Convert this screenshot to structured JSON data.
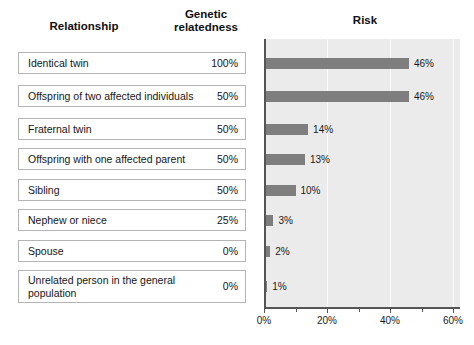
{
  "figure": {
    "table_headers": {
      "relationship": "Relationship",
      "relatedness": "Genetic\nrelatedness"
    },
    "relatedness_header_line1": "Genetic",
    "relatedness_header_line2": "relatedness",
    "rows": [
      {
        "label": "Identical twin",
        "relatedness": "100%",
        "risk_label": "46%"
      },
      {
        "label": "Offspring of two affected individuals",
        "relatedness": "50%",
        "risk_label": "46%"
      },
      {
        "label": "Fraternal twin",
        "relatedness": "50%",
        "risk_label": "14%"
      },
      {
        "label": "Offspring with one affected parent",
        "relatedness": "50%",
        "risk_label": "13%"
      },
      {
        "label": "Sibling",
        "relatedness": "50%",
        "risk_label": "10%"
      },
      {
        "label": "Nephew or niece",
        "relatedness": "25%",
        "risk_label": "3%"
      },
      {
        "label": "Spouse",
        "relatedness": "0%",
        "risk_label": "2%"
      },
      {
        "label": "Unrelated person in the general population",
        "relatedness": "0%",
        "risk_label": "1%"
      }
    ]
  },
  "chart_data": {
    "type": "bar",
    "orientation": "horizontal",
    "title": "Risk",
    "xlabel": "",
    "ylabel": "",
    "categories": [
      "Identical twin",
      "Offspring of two affected individuals",
      "Fraternal twin",
      "Offspring with one affected parent",
      "Sibling",
      "Nephew or niece",
      "Spouse",
      "Unrelated person in the general population"
    ],
    "values": [
      46,
      46,
      14,
      13,
      10,
      3,
      2,
      1
    ],
    "data_labels": [
      "46%",
      "46%",
      "14%",
      "13%",
      "10%",
      "3%",
      "2%",
      "1%"
    ],
    "xlim": [
      0,
      60
    ],
    "xticks": [
      0,
      20,
      40,
      60
    ],
    "xtick_labels": [
      "0%",
      "20%",
      "40%",
      "60%"
    ],
    "grid": true,
    "legend": "none",
    "bar_color": "#7e7e7e",
    "plot_background": "#ebebeb"
  }
}
